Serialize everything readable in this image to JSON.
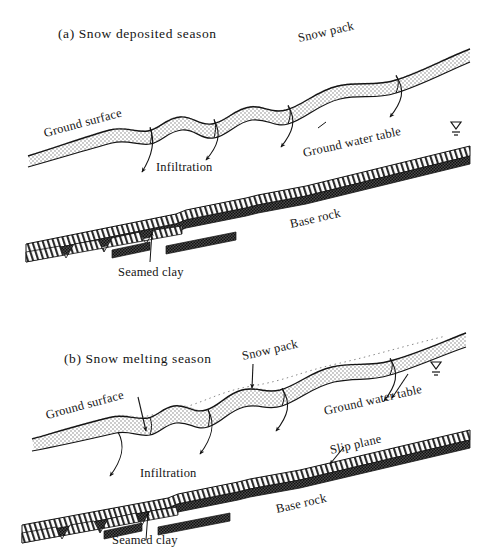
{
  "figure": {
    "kind": "geotechnical-cross-section",
    "background_color": "#ffffff",
    "ink_color": "#141414",
    "panels": [
      {
        "id": "a",
        "title": "(a) Snow deposited season",
        "labels": {
          "ground_surface": "Ground surface",
          "snow_pack": "Snow pack",
          "infiltration": "Infiltration",
          "ground_water_table": "Ground water table",
          "base_rock": "Base rock",
          "seamed_clay": "Seamed clay"
        },
        "symbols": {
          "water_table": "water-table-symbol"
        }
      },
      {
        "id": "b",
        "title": "(b) Snow melting season",
        "labels": {
          "ground_surface": "Ground surface",
          "snow_pack": "Snow pack",
          "infiltration": "Infiltration",
          "ground_water_table": "Ground water table",
          "slip_plane": "Slip plane",
          "base_rock": "Base rock",
          "seamed_clay": "Seamed clay"
        },
        "symbols": {
          "water_table": "water-table-symbol"
        }
      }
    ],
    "legend_materials": {
      "snow_pack_fill": "stipple-dots",
      "base_rock_fill": "diagonal-hatch",
      "seamed_clay_fill": "dark-checker"
    },
    "colors": {
      "stipple": "#6f6f6f",
      "hatch": "#2a2a2a",
      "checker": "#3a3a3a",
      "outline": "#141414"
    }
  }
}
